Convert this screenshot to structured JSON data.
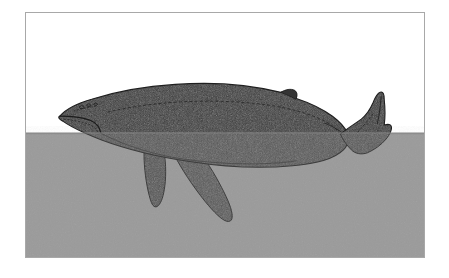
{
  "image": {
    "title": "Humpback whale swimming at the water surface",
    "subject": "whale",
    "style": "grayscale stippled illustration",
    "frame": {
      "border_color": "#a8a8a8",
      "border_width_px": 1,
      "x": 25,
      "y": 12,
      "width": 400,
      "height": 246
    }
  },
  "colors": {
    "page_background": "#ffffff",
    "sky_above_water": "#ffffff",
    "water": "#9a9a9a",
    "water_shadow": "#949494",
    "whale_body_above_water": "#3a3a3a",
    "whale_body_below_water": "#4c4c4c",
    "whale_outline": "#1f1f1f",
    "detail_line": "#262626",
    "frame_border": "#a8a8a8"
  },
  "scene": {
    "waterline_y": 121,
    "water_label": "water surface",
    "sky_label": "air above surface",
    "canvas": {
      "width": 400,
      "height": 246
    }
  },
  "whale": {
    "name": "humpback-whale",
    "orientation": "facing left",
    "parts": [
      {
        "id": "body",
        "label": "whale body"
      },
      {
        "id": "head",
        "label": "head and rostrum"
      },
      {
        "id": "mouth-line",
        "label": "mouth / jaw line"
      },
      {
        "id": "blowhole-marks",
        "label": "blowhole markings"
      },
      {
        "id": "dorsal-fin",
        "label": "dorsal fin"
      },
      {
        "id": "belly-contour",
        "label": "belly contour line"
      },
      {
        "id": "flank-line",
        "label": "flank contour line"
      },
      {
        "id": "pectoral-fin-rear",
        "label": "rear pectoral fin"
      },
      {
        "id": "pectoral-fin-front",
        "label": "front pectoral fin"
      },
      {
        "id": "peduncle",
        "label": "tail stock / peduncle"
      },
      {
        "id": "tail-fluke",
        "label": "tail fluke"
      }
    ],
    "bounds": {
      "x_min": 32,
      "x_max": 368,
      "y_min": 68,
      "y_max": 216
    }
  }
}
